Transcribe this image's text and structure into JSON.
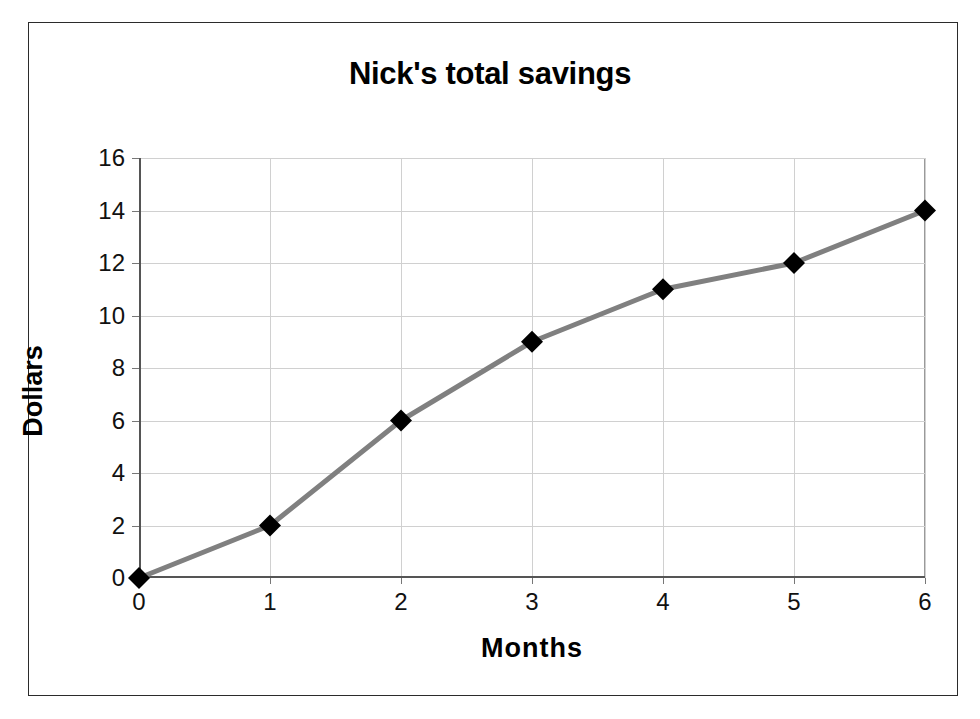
{
  "chart_data": {
    "type": "line",
    "title": "Nick's total savings",
    "xlabel": "Months",
    "ylabel": "Dollars",
    "x": [
      0,
      1,
      2,
      3,
      4,
      5,
      6
    ],
    "values": [
      0,
      2,
      6,
      9,
      11,
      12,
      14
    ],
    "series": [
      {
        "name": "Total savings",
        "x": [
          0,
          1,
          2,
          3,
          4,
          5,
          6
        ],
        "values": [
          0,
          2,
          6,
          9,
          11,
          12,
          14
        ]
      }
    ],
    "xlim": [
      0,
      6
    ],
    "ylim": [
      0,
      16
    ],
    "xticks": [
      0,
      1,
      2,
      3,
      4,
      5,
      6
    ],
    "yticks": [
      0,
      2,
      4,
      6,
      8,
      10,
      12,
      14,
      16
    ],
    "xtick_labels": [
      "0",
      "1",
      "2",
      "3",
      "4",
      "5",
      "6"
    ],
    "ytick_labels": [
      "0",
      "2",
      "4",
      "6",
      "8",
      "10",
      "12",
      "14",
      "16"
    ],
    "grid": true,
    "grid_axis": "both",
    "legend": false,
    "legend_position": "none",
    "marker": "diamond",
    "marker_color": "#000000",
    "line_color": "#808080",
    "line_width": 5,
    "background_color": "#ffffff",
    "gridline_color": "#d0d0d0",
    "axis_color": "#555555",
    "frame_color": "#2b2b2b",
    "annotations": []
  }
}
